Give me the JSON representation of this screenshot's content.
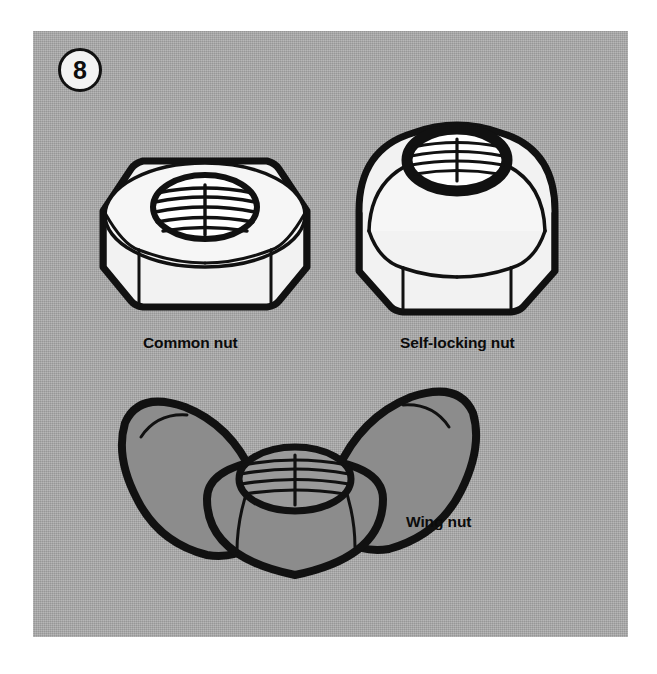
{
  "figure": {
    "number": "8",
    "panel_color": "#a9a9a9",
    "outline_color": "#111111",
    "metal_fill_color": "#f2f2f2",
    "wing_fill_color": "#8c8c8c"
  },
  "items": [
    {
      "id": "common-nut",
      "label": "Common nut",
      "icon": "hex-nut-icon"
    },
    {
      "id": "self-locking-nut",
      "label": "Self-locking nut",
      "icon": "domed-lock-nut-icon"
    },
    {
      "id": "wing-nut",
      "label": "Wing nut",
      "icon": "wing-nut-icon"
    }
  ]
}
